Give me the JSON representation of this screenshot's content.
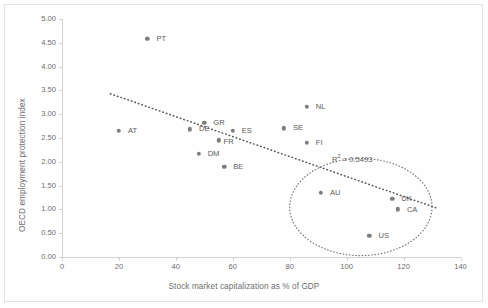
{
  "chart_data": {
    "type": "scatter",
    "title": "",
    "xlabel": "Stock market capitalization as % of GDP",
    "ylabel": "OECD employment protection index",
    "xlim": [
      0,
      140
    ],
    "ylim": [
      0,
      5.0
    ],
    "xticks": [
      "0",
      "20",
      "40",
      "60",
      "80",
      "100",
      "120",
      "140"
    ],
    "xtick_values": [
      0,
      20,
      40,
      60,
      80,
      100,
      120,
      140
    ],
    "yticks": [
      "0.00",
      "0.50",
      "1.00",
      "1.50",
      "2.00",
      "2.50",
      "3.00",
      "3.50",
      "4.00",
      "4.50",
      "5.00"
    ],
    "ytick_values": [
      0,
      0.5,
      1.0,
      1.5,
      2.0,
      2.5,
      3.0,
      3.5,
      4.0,
      4.5,
      5.0
    ],
    "grid": false,
    "legend": "none",
    "marker_color": "#7d7d7d",
    "text_color": "#5c5c5c",
    "axis_color": "#d2d2d2",
    "points": [
      {
        "label": "PT",
        "x": 30,
        "y": 4.58,
        "label_dx": 9,
        "label_dy": 0
      },
      {
        "label": "AT",
        "x": 20,
        "y": 2.65,
        "label_dx": 9,
        "label_dy": 0
      },
      {
        "label": "DE",
        "x": 45,
        "y": 2.68,
        "label_dx": 9,
        "label_dy": 0
      },
      {
        "label": "GR",
        "x": 50,
        "y": 2.82,
        "label_dx": 9,
        "label_dy": 0
      },
      {
        "label": "DM",
        "x": 48,
        "y": 2.17,
        "label_dx": 9,
        "label_dy": 0
      },
      {
        "label": "FR",
        "x": 55,
        "y": 2.45,
        "label_dx": 5,
        "label_dy": 2
      },
      {
        "label": "BE",
        "x": 57,
        "y": 1.9,
        "label_dx": 9,
        "label_dy": 0
      },
      {
        "label": "ES",
        "x": 60,
        "y": 2.65,
        "label_dx": 9,
        "label_dy": 0
      },
      {
        "label": "SE",
        "x": 78,
        "y": 2.7,
        "label_dx": 9,
        "label_dy": 0
      },
      {
        "label": "NL",
        "x": 86,
        "y": 3.15,
        "label_dx": 9,
        "label_dy": 0
      },
      {
        "label": "FI",
        "x": 86,
        "y": 2.4,
        "label_dx": 9,
        "label_dy": 0
      },
      {
        "label": "AU",
        "x": 91,
        "y": 1.35,
        "label_dx": 9,
        "label_dy": 0
      },
      {
        "label": "UK",
        "x": 116,
        "y": 1.22,
        "label_dx": 9,
        "label_dy": 0
      },
      {
        "label": "CA",
        "x": 118,
        "y": 1.0,
        "label_dx": 9,
        "label_dy": 1
      },
      {
        "label": "US",
        "x": 108,
        "y": 0.45,
        "label_dx": 9,
        "label_dy": 0
      }
    ],
    "trendline": {
      "label_prefix": "R",
      "label_superscript": "2",
      "label_suffix": " = 0.5493",
      "annotation": "R² = 0.5493",
      "x_start": 17,
      "y_start": 3.43,
      "x_end": 132,
      "y_end": 1.02,
      "style": "dotted"
    },
    "highlight_ellipse": {
      "center_x": 105,
      "center_y": 1.05,
      "radius_x": 25,
      "radius_y": 1.02,
      "style": "dotted"
    }
  }
}
